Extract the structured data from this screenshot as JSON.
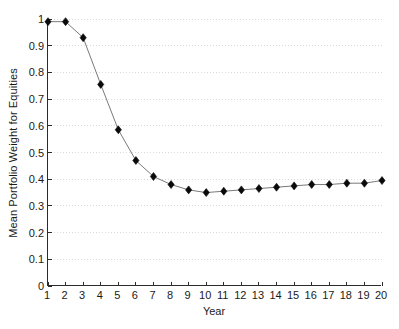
{
  "chart_data": {
    "type": "line",
    "title": "",
    "xlabel": "Year",
    "ylabel": "Mean Portfolio Weight for Equities",
    "x": [
      1,
      2,
      3,
      4,
      5,
      6,
      7,
      8,
      9,
      10,
      11,
      12,
      13,
      14,
      15,
      16,
      17,
      18,
      19,
      20
    ],
    "values": [
      0.99,
      0.99,
      0.93,
      0.755,
      0.585,
      0.47,
      0.41,
      0.38,
      0.36,
      0.35,
      0.355,
      0.36,
      0.365,
      0.37,
      0.375,
      0.38,
      0.38,
      0.385,
      0.385,
      0.395
    ],
    "series": [
      {
        "name": "Mean Portfolio Weight for Equities",
        "values": [
          0.99,
          0.99,
          0.93,
          0.755,
          0.585,
          0.47,
          0.41,
          0.38,
          0.36,
          0.35,
          0.355,
          0.36,
          0.365,
          0.37,
          0.375,
          0.38,
          0.38,
          0.385,
          0.385,
          0.395
        ]
      }
    ],
    "xlim": [
      1,
      20
    ],
    "ylim": [
      0,
      1
    ],
    "xticks": [
      1,
      2,
      3,
      4,
      5,
      6,
      7,
      8,
      9,
      10,
      11,
      12,
      13,
      14,
      15,
      16,
      17,
      18,
      19,
      20
    ],
    "xtick_labels": [
      "1",
      "2",
      "3",
      "4",
      "5",
      "6",
      "7",
      "8",
      "9",
      "10",
      "11",
      "12",
      "13",
      "14",
      "15",
      "16",
      "17",
      "18",
      "19",
      "20"
    ],
    "yticks": [
      0,
      0.1,
      0.2,
      0.3,
      0.4,
      0.5,
      0.6,
      0.7,
      0.8,
      0.9,
      1
    ],
    "ytick_labels": [
      "0",
      "0.1",
      "0.2",
      "0.3",
      "0.4",
      "0.5",
      "0.6",
      "0.7",
      "0.8",
      "0.9",
      "1"
    ],
    "grid": true,
    "grid_axis": "y",
    "legend": false,
    "legend_position": "none",
    "marker": "diamond",
    "line_color": "#7a7a7a",
    "marker_color": "#0a0a0a",
    "grid_color": "#d9d9d9",
    "axis_color": "#2b2b2b",
    "background": "#ffffff"
  }
}
